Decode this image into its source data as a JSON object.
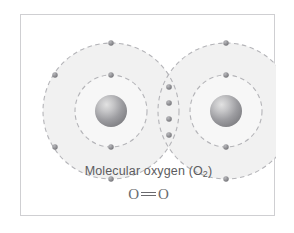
{
  "figure": {
    "caption_line1_prefix": "Molecular oxygen (O",
    "caption_line1_sub": "2",
    "caption_line1_suffix": ")",
    "caption_line1_full": "Molecular oxygen (O₂)",
    "formula_left_atom": "O",
    "formula_right_atom": "O",
    "formula_bond": "double-bond",
    "formula_full": "O=O",
    "colors": {
      "frame_border": "#cfcfd2",
      "background": "#ffffff",
      "shell_fill": "#f1f1f1",
      "shell_stroke": "#b8b8bc",
      "electron": "#8a8a8e",
      "nucleus_light": "#d9d9d9",
      "nucleus_dark": "#7a7a7e",
      "caption_text": "#5c5c60"
    },
    "atoms": [
      {
        "label": "oxygen-atom-left",
        "nucleus": {
          "cx": 90,
          "cy": 96,
          "r": 16
        },
        "inner_shell": {
          "cx": 90,
          "cy": 96,
          "r": 36,
          "electron_count": 2
        },
        "outer_shell": {
          "cx": 90,
          "cy": 96,
          "r": 68,
          "electron_count": 4
        },
        "inner_electrons": [
          {
            "cx": 90,
            "cy": 60
          },
          {
            "cx": 90,
            "cy": 132
          }
        ],
        "outer_electrons": [
          {
            "cx": 90,
            "cy": 28
          },
          {
            "cx": 34,
            "cy": 60
          },
          {
            "cx": 34,
            "cy": 132
          },
          {
            "cx": 90,
            "cy": 164
          }
        ]
      },
      {
        "label": "oxygen-atom-right",
        "nucleus": {
          "cx": 205,
          "cy": 96,
          "r": 16
        },
        "inner_shell": {
          "cx": 205,
          "cy": 96,
          "r": 36,
          "electron_count": 2
        },
        "outer_shell": {
          "cx": 205,
          "cy": 96,
          "r": 68,
          "electron_count": 4
        },
        "inner_electrons": [
          {
            "cx": 205,
            "cy": 60
          },
          {
            "cx": 205,
            "cy": 132
          }
        ],
        "outer_electrons": [
          {
            "cx": 205,
            "cy": 28
          },
          {
            "cx": 261,
            "cy": 60
          },
          {
            "cx": 261,
            "cy": 132
          },
          {
            "cx": 205,
            "cy": 164
          }
        ]
      }
    ],
    "shared_electrons": [
      {
        "cx": 148,
        "cy": 72
      },
      {
        "cx": 148,
        "cy": 88
      },
      {
        "cx": 148,
        "cy": 104
      },
      {
        "cx": 148,
        "cy": 120
      }
    ],
    "shared_electron_count": 4,
    "bond_description": "double covalent bond"
  }
}
